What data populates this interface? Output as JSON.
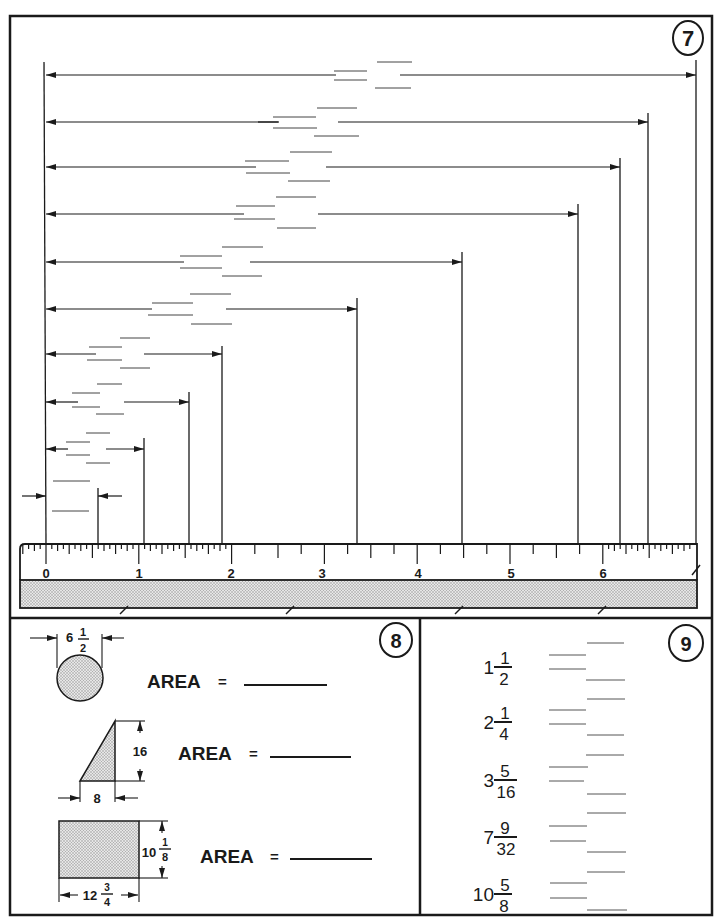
{
  "page": {
    "background": "#ffffff",
    "ink": "#1a1a1a",
    "stipple": "#bdbdbd"
  },
  "figure7": {
    "number": "7",
    "ruler": {
      "labels": [
        "0",
        "1",
        "2",
        "3",
        "4",
        "5",
        "6"
      ],
      "subdivision": "1/16 inch near ends, 1/4 inch in middle",
      "break_marks": 5
    },
    "dimension_lines": [
      {
        "id": 1,
        "answer_blanks": 4
      },
      {
        "id": 2,
        "answer_blanks": 4
      },
      {
        "id": 3,
        "answer_blanks": 4
      },
      {
        "id": 4,
        "answer_blanks": 4
      },
      {
        "id": 5,
        "answer_blanks": 4
      },
      {
        "id": 6,
        "answer_blanks": 4
      },
      {
        "id": 7,
        "answer_blanks": 4
      },
      {
        "id": 8,
        "answer_blanks": 4
      },
      {
        "id": 9,
        "answer_blanks": 4
      },
      {
        "id": 10,
        "answer_blanks": 2
      }
    ]
  },
  "figure8": {
    "number": "8",
    "shapes": [
      {
        "shape": "circle",
        "dimension_whole": "6",
        "dimension_num": "1",
        "dimension_den": "2",
        "area_label": "AREA",
        "equals": "="
      },
      {
        "shape": "right-triangle",
        "height": "16",
        "base": "8",
        "area_label": "AREA",
        "equals": "="
      },
      {
        "shape": "rectangle",
        "height_whole": "10",
        "height_num": "1",
        "height_den": "8",
        "width_whole": "12",
        "width_num": "3",
        "width_den": "4",
        "area_label": "AREA",
        "equals": "="
      }
    ]
  },
  "figure9": {
    "number": "9",
    "fractions": [
      {
        "whole": "1",
        "num": "1",
        "den": "2"
      },
      {
        "whole": "2",
        "num": "1",
        "den": "4"
      },
      {
        "whole": "3",
        "num": "5",
        "den": "16"
      },
      {
        "whole": "7",
        "num": "9",
        "den": "32"
      },
      {
        "whole": "10",
        "num": "5",
        "den": "8"
      }
    ]
  }
}
